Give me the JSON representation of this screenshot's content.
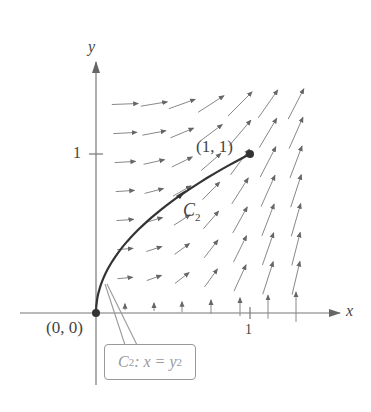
{
  "chart_data": {
    "type": "vector-field-with-curve",
    "title": "",
    "xlabel": "x",
    "ylabel": "y",
    "x_ticks": [
      "1"
    ],
    "y_ticks": [
      "1"
    ],
    "curve": {
      "name": "C2",
      "equation": "x = y^2",
      "from": [
        0,
        0
      ],
      "to": [
        1,
        1
      ],
      "direction": "from (0,0) to (1,1)"
    },
    "points": [
      {
        "label": "(0, 0)",
        "x": 0,
        "y": 0
      },
      {
        "label": "(1, 1)",
        "x": 1,
        "y": 1
      }
    ],
    "field_grid": {
      "x_range": [
        0.19,
        1.31
      ],
      "y_range": [
        0,
        1.36
      ],
      "spacing": 0.1875
    }
  },
  "labels": {
    "x_axis": "x",
    "y_axis": "y",
    "x_tick_1": "1",
    "y_tick_1": "1",
    "origin": "(0, 0)",
    "end_point": "(1, 1)",
    "curve_name": "C",
    "curve_sub": "2",
    "callout_c": "C",
    "callout_sub": "2",
    "callout_eq": ": x = y",
    "callout_sup": "2"
  }
}
